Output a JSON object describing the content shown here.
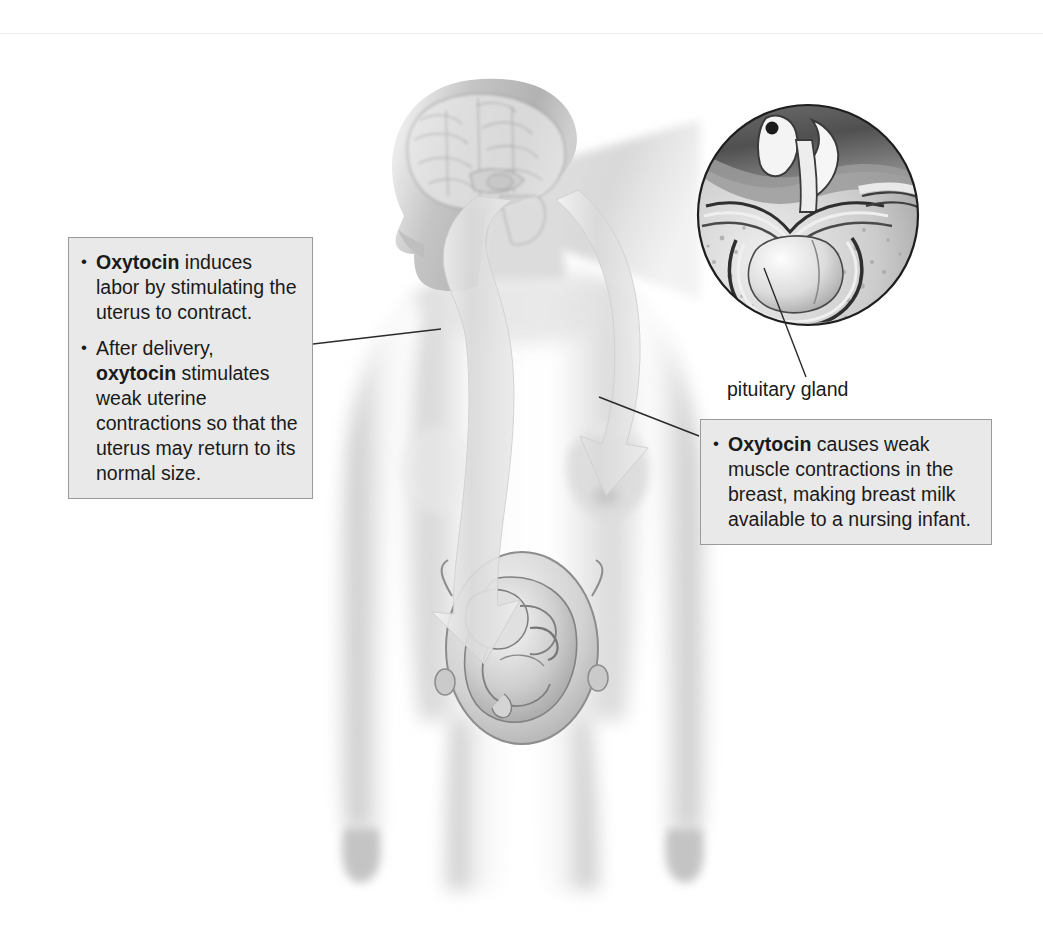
{
  "page": {
    "width": 1043,
    "height": 928,
    "background": "#ffffff",
    "artwork_style": "grayscale medical illustration, pencil/airbrush shading"
  },
  "colors": {
    "callout_fill": "#e9e9e9",
    "callout_border": "#9a9a9a",
    "text": "#1a1a1a",
    "leader_line": "#2b2b2b",
    "body_shade_light": "#f2f2f2",
    "body_shade_mid": "#c9c9c9",
    "body_shade_dark": "#8f8f8f",
    "arrow_fill": "#dcdcdc",
    "inset_dark": "#4a4a4a"
  },
  "callouts": [
    {
      "id": "callout-left",
      "name": "oxytocin-uterus-callout",
      "bullets": [
        {
          "lead": "Oxytocin",
          "rest": " induces labor by stimulating the uterus to contract."
        },
        {
          "pre": "After delivery, ",
          "lead": "oxytocin",
          "rest": " stimulates weak uterine contractions so that the uterus may return to its normal size."
        }
      ]
    },
    {
      "id": "callout-right",
      "name": "oxytocin-breast-callout",
      "bullets": [
        {
          "lead": "Oxytocin",
          "rest": " causes weak muscle contractions in the breast, making breast milk available to a nursing infant."
        }
      ]
    }
  ],
  "labels": {
    "pituitary_gland": "pituitary gland"
  },
  "anatomy": {
    "figure": "pregnant female figure, anterior view, head in left profile",
    "parts": [
      "brain",
      "pituitary gland",
      "breast",
      "uterus",
      "fetus"
    ],
    "inset": {
      "name": "pituitary-gland-inset",
      "shape": "circle",
      "center_x": 808,
      "center_y": 215,
      "radius": 110,
      "depicts": "midsagittal cutaway of hypothalamus, pituitary stalk and pituitary gland within sella turcica"
    },
    "arrows": [
      {
        "name": "oxytocin-flow-to-uterus",
        "from": "pituitary / brain",
        "to": "uterus"
      },
      {
        "name": "oxytocin-flow-to-breast",
        "from": "pituitary / brain",
        "to": "breast"
      }
    ]
  },
  "leaders": [
    {
      "name": "leader-left-callout",
      "from": [
        313,
        344
      ],
      "to": [
        441,
        329
      ]
    },
    {
      "name": "leader-right-callout",
      "from": [
        699,
        436
      ],
      "to": [
        599,
        397
      ]
    },
    {
      "name": "leader-pituitary-label",
      "from": [
        764,
        268
      ],
      "to": [
        806,
        377
      ]
    }
  ]
}
